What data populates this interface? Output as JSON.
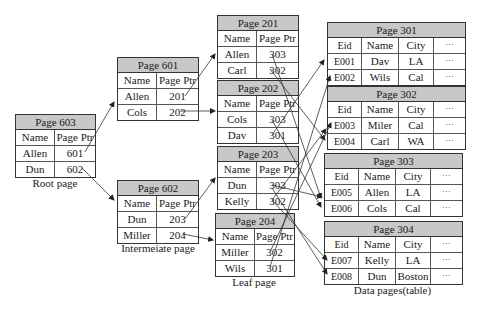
{
  "root": {
    "title": "Page 603",
    "headers": [
      "Name",
      "Page Ptr"
    ],
    "rows": [
      [
        "Allen",
        "601"
      ],
      [
        "Dun",
        "602"
      ]
    ],
    "caption": "Root page"
  },
  "intermediate": [
    {
      "title": "Page 601",
      "headers": [
        "Name",
        "Page Ptr"
      ],
      "rows": [
        [
          "Allen",
          "201"
        ],
        [
          "Cols",
          "202"
        ]
      ]
    },
    {
      "title": "Page 602",
      "headers": [
        "Name",
        "Page Ptr"
      ],
      "rows": [
        [
          "Dun",
          "203"
        ],
        [
          "Miller",
          "204"
        ]
      ]
    }
  ],
  "intermediate_caption": "Intermeiate page",
  "leaf": [
    {
      "title": "Page 201",
      "headers": [
        "Name",
        "Page Ptr"
      ],
      "rows": [
        [
          "Allen",
          "303"
        ],
        [
          "Carl",
          "302"
        ]
      ]
    },
    {
      "title": "Page 202",
      "headers": [
        "Name",
        "Page Ptr"
      ],
      "rows": [
        [
          "Cols",
          "303"
        ],
        [
          "Dav",
          "301"
        ]
      ]
    },
    {
      "title": "Page 203",
      "headers": [
        "Name",
        "Page Ptr"
      ],
      "rows": [
        [
          "Dun",
          "303"
        ],
        [
          "Kelly",
          "302"
        ]
      ]
    },
    {
      "title": "Page 204",
      "headers": [
        "Name",
        "Page Ptr"
      ],
      "rows": [
        [
          "Miller",
          "302"
        ],
        [
          "Wils",
          "301"
        ]
      ]
    }
  ],
  "leaf_caption": "Leaf page",
  "data_pages": [
    {
      "title": "Page 301",
      "headers": [
        "Eid",
        "Name",
        "City",
        "⋯"
      ],
      "rows": [
        [
          "E001",
          "Dav",
          "LA",
          "⋯"
        ],
        [
          "E002",
          "Wils",
          "Cal",
          "⋯"
        ]
      ]
    },
    {
      "title": "Page 302",
      "headers": [
        "Eid",
        "Name",
        "City",
        "⋯"
      ],
      "rows": [
        [
          "E003",
          "Miler",
          "Cal",
          "⋯"
        ],
        [
          "E004",
          "Carl",
          "WA",
          "⋯"
        ]
      ]
    },
    {
      "title": "Page 303",
      "headers": [
        "Eid",
        "Name",
        "City",
        "⋯"
      ],
      "rows": [
        [
          "E005",
          "Allen",
          "LA",
          "⋯"
        ],
        [
          "E006",
          "Cols",
          "Cal",
          "⋯"
        ]
      ]
    },
    {
      "title": "Page 304",
      "headers": [
        "Eid",
        "Name",
        "City",
        "⋯"
      ],
      "rows": [
        [
          "E007",
          "Kelly",
          "LA",
          "⋯"
        ],
        [
          "E008",
          "Dun",
          "Boston",
          "⋯"
        ]
      ]
    }
  ],
  "data_caption": "Data pages(table)"
}
